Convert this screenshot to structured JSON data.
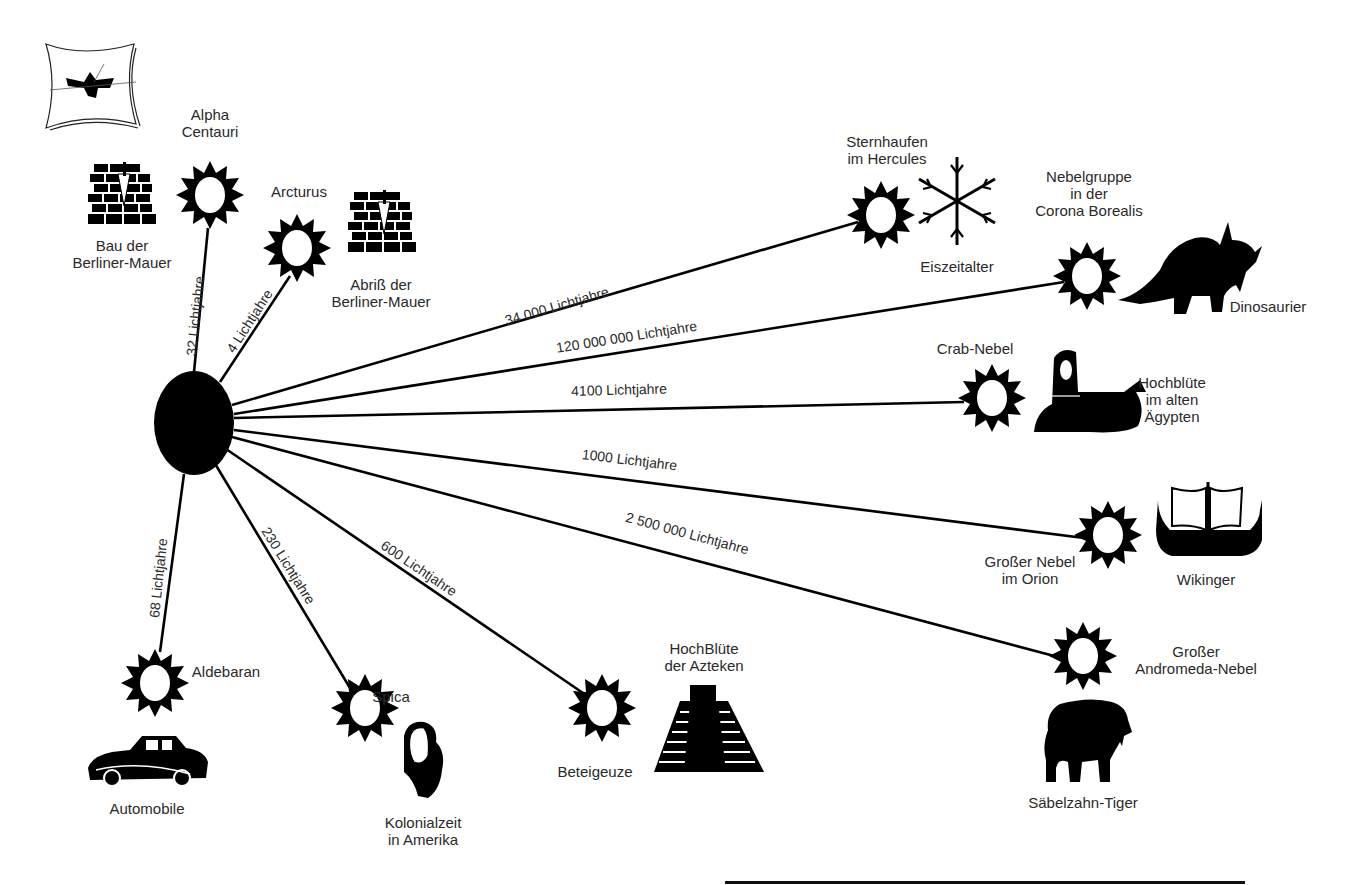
{
  "diagram": {
    "center": {
      "name": "earth",
      "x": 194,
      "y": 423,
      "rx": 40,
      "ry": 52,
      "color": "#000000"
    },
    "line_color": "#000000",
    "connections": [
      {
        "id": "alpha-centauri",
        "distance": "32 Lichtjahre",
        "star": "Alpha\nCentauri",
        "event": "Bau der\nBerliner-Mauer",
        "event_icon": "brick-wall-icon",
        "sx": 210,
        "sy": 195
      },
      {
        "id": "arcturus",
        "distance": "4 Lichtjahre",
        "star": "Arcturus",
        "event": "Abriß der\nBerliner-Mauer",
        "event_icon": "brick-wall-icon",
        "sx": 297,
        "sy": 248
      },
      {
        "id": "sternhaufen-hercules",
        "distance": "34 000 Lichtjahre",
        "star": "Sternhaufen\nim Hercules",
        "event": "Eiszeitalter",
        "event_icon": "snowflake-icon",
        "sx": 880,
        "sy": 215
      },
      {
        "id": "nebelgruppe-corona-borealis",
        "distance": "120 000 000 Lichtjahre",
        "star": "Nebelgruppe\nin der\nCorona Borealis",
        "event": "Dinosaurier",
        "event_icon": "triceratops-icon",
        "sx": 1087,
        "sy": 276
      },
      {
        "id": "crab-nebel",
        "distance": "4100 Lichtjahre",
        "star": "Crab-Nebel",
        "event": "Hochblüte\nim alten\nÄgypten",
        "event_icon": "sphinx-icon",
        "sx": 992,
        "sy": 398
      },
      {
        "id": "grosser-nebel-orion",
        "distance": "1000 Lichtjahre",
        "star": "Großer Nebel\nim Orion",
        "event": "Wikinger",
        "event_icon": "viking-ship-icon",
        "sx": 1108,
        "sy": 535
      },
      {
        "id": "andromeda",
        "distance": "2 500 000 Lichtjahre",
        "star": "Großer\nAndromeda-Nebel",
        "event": "Säbelzahn-Tiger",
        "event_icon": "sabertooth-tiger-icon",
        "sx": 1083,
        "sy": 656
      },
      {
        "id": "beteigeuze",
        "distance": "600 Lichtjahre",
        "star": "Beteigeuze",
        "event": "HochBlüte\nder Azteken",
        "event_icon": "aztec-pyramid-icon",
        "sx": 602,
        "sy": 708
      },
      {
        "id": "spica",
        "distance": "230 Lichtjahre",
        "star": "Spica",
        "event": "Kolonialzeit\nin Amerika",
        "event_icon": "colonial-portrait-icon",
        "sx": 365,
        "sy": 708
      },
      {
        "id": "aldebaran",
        "distance": "68 Lichtjahre",
        "star": "Aldebaran",
        "event": "Automobile",
        "event_icon": "vintage-car-icon",
        "sx": 155,
        "sy": 683
      }
    ]
  },
  "labels": {
    "alpha_centauri": "Alpha\nCentauri",
    "bau_mauer": "Bau der\nBerliner-Mauer",
    "arcturus": "Arcturus",
    "abriss_mauer": "Abriß der\nBerliner-Mauer",
    "hercules": "Sternhaufen\nim Hercules",
    "eiszeit": "Eiszeitalter",
    "corona": "Nebelgruppe\nin der\nCorona Borealis",
    "dino": "Dinosaurier",
    "crab": "Crab-Nebel",
    "aegypten": "Hochblüte\nim alten\nÄgypten",
    "orion": "Großer Nebel\nim Orion",
    "wikinger": "Wikinger",
    "andromeda": "Großer\nAndromeda-Nebel",
    "tiger": "Säbelzahn-Tiger",
    "beteigeuze": "Beteigeuze",
    "azteken": "HochBlüte\nder Azteken",
    "spica": "Spica",
    "kolonial": "Kolonialzeit\nin Amerika",
    "aldebaran": "Aldebaran",
    "automobile": "Automobile"
  },
  "distances": {
    "d32": "32 Lichtjahre",
    "d4": "4 Lichtjahre",
    "d34000": "34 000 Lichtjahre",
    "d120m": "120 000 000 Lichtjahre",
    "d4100": "4100 Lichtjahre",
    "d1000": "1000 Lichtjahre",
    "d2500000": "2 500 000 Lichtjahre",
    "d600": "600 Lichtjahre",
    "d230": "230 Lichtjahre",
    "d68": "68 Lichtjahre"
  },
  "logo": {
    "icon": "exploding-window-logo-icon"
  }
}
